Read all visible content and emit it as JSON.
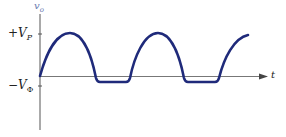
{
  "diagram": {
    "y_axis_label": "v",
    "y_axis_sub": "o",
    "x_axis_label": "t",
    "tick_top_label": "+V",
    "tick_top_sub": "P",
    "tick_bottom_label": "−V",
    "tick_bottom_sub": "Φ",
    "curve_color": "#1f2a7a",
    "axis_color": "#555555",
    "label_color": "#6a7ab0"
  }
}
